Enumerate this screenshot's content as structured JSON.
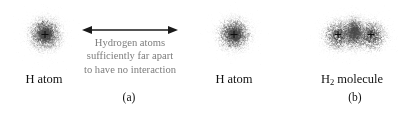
{
  "figure": {
    "background_color": "#ffffff",
    "width": 403,
    "height": 114,
    "text_color": "#111111",
    "caption_color": "#7d7d7d",
    "nucleus_color": "#0d0d0d",
    "cloud_color": "#4a4a4a"
  },
  "panel_a": {
    "label": "(a)",
    "caption": {
      "line1": "Hydrogen atoms",
      "line2": "sufficiently far apart",
      "line3": "to have no interaction"
    },
    "left_atom": {
      "label": "H atom",
      "nucleus_symbol": "+"
    },
    "right_atom": {
      "label": "H atom",
      "nucleus_symbol": "+"
    },
    "arrow": {
      "name": "double-headed-arrow",
      "direction": "both"
    }
  },
  "panel_b": {
    "label": "(b)",
    "molecule": {
      "label_prefix": "H",
      "label_subscript": "2",
      "label_suffix": " molecule",
      "left_nucleus_symbol": "+",
      "right_nucleus_symbol": "+"
    }
  }
}
